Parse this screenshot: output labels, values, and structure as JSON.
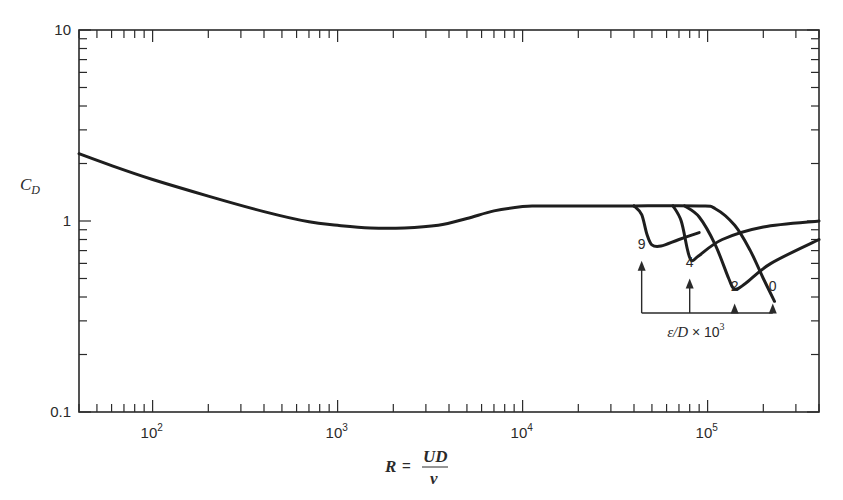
{
  "chart_data": {
    "type": "line",
    "title": "",
    "xlabel": "R = UD/ν",
    "xlabel_parts": {
      "lhs": "R",
      "eq": "=",
      "num": "UD",
      "den": "ν"
    },
    "ylabel": "C_D",
    "ylabel_parts": {
      "main": "C",
      "sub": "D"
    },
    "xscale": "log",
    "yscale": "log",
    "xlim": [
      40,
      400000
    ],
    "ylim": [
      0.1,
      10
    ],
    "grid": false,
    "x_ticks": [
      {
        "value": 100,
        "base": "10",
        "exp": "2"
      },
      {
        "value": 1000,
        "base": "10",
        "exp": "3"
      },
      {
        "value": 10000,
        "base": "10",
        "exp": "4"
      },
      {
        "value": 100000,
        "base": "10",
        "exp": "5"
      }
    ],
    "y_ticks": [
      {
        "value": 10,
        "label": "10"
      },
      {
        "value": 1,
        "label": "1"
      },
      {
        "value": 0.1,
        "label": "0.1"
      }
    ],
    "series": [
      {
        "name": "smooth (common curve)",
        "x": [
          40,
          60,
          100,
          200,
          400,
          700,
          1000,
          1500,
          2300,
          3500,
          5000,
          7000,
          10000,
          12000,
          20000,
          40000
        ],
        "y": [
          2.25,
          1.95,
          1.65,
          1.35,
          1.12,
          0.99,
          0.95,
          0.92,
          0.92,
          0.95,
          1.03,
          1.13,
          1.19,
          1.2,
          1.2,
          1.2
        ]
      },
      {
        "name": "ε/D × 10³ = 9",
        "x": [
          40000,
          44000,
          47000,
          50000,
          56000,
          70000,
          90000
        ],
        "y": [
          1.2,
          1.08,
          0.85,
          0.75,
          0.74,
          0.8,
          0.87
        ]
      },
      {
        "name": "ε/D × 10³ = 4",
        "x": [
          65000,
          72000,
          78000,
          82000,
          90000,
          120000,
          200000,
          400000
        ],
        "y": [
          1.2,
          1.0,
          0.7,
          0.62,
          0.66,
          0.8,
          0.93,
          1.0
        ]
      },
      {
        "name": "ε/D × 10³ = 2",
        "x": [
          75000,
          90000,
          110000,
          130000,
          140000,
          160000,
          220000,
          400000
        ],
        "y": [
          1.2,
          1.05,
          0.75,
          0.5,
          0.44,
          0.47,
          0.6,
          0.8
        ]
      },
      {
        "name": "ε/D × 10³ = 0",
        "x": [
          40000,
          90000,
          110000,
          140000,
          170000,
          200000,
          230000
        ],
        "y": [
          1.2,
          1.2,
          1.16,
          0.95,
          0.7,
          0.5,
          0.38
        ]
      }
    ],
    "annotations": {
      "group_label": {
        "text": "ε/D × 10",
        "exp": "3"
      },
      "arrows": [
        {
          "label": "9",
          "x": 44000,
          "tip_cd": 0.62,
          "label_cd": 0.7
        },
        {
          "label": "4",
          "x": 80000,
          "tip_cd": 0.5,
          "label_cd": 0.56
        },
        {
          "label": "2",
          "x": 140000,
          "tip_cd": 0.37,
          "label_cd": 0.42
        },
        {
          "label": "0",
          "x": 225000,
          "tip_cd": 0.37,
          "label_cd": 0.42
        }
      ],
      "bracket_cd": 0.33
    }
  }
}
